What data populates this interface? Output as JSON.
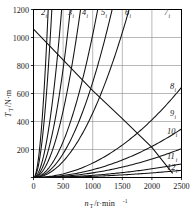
{
  "chart_data": {
    "type": "line",
    "title": "",
    "xlabel": "n_T /r·min⁻¹",
    "ylabel": "T_T /N·m",
    "xlim": [
      0,
      2500
    ],
    "ylim": [
      0,
      1200
    ],
    "xticks": [
      0,
      500,
      1000,
      1500,
      2000,
      2500
    ],
    "xticklabels": [
      "0",
      "500",
      "1000",
      "1500",
      "2000",
      "2500"
    ],
    "yticks": [
      0,
      200,
      400,
      600,
      800,
      1000,
      1200
    ],
    "yticklabels": [
      "0",
      "200",
      "400",
      "600",
      "800",
      "1000",
      "1200"
    ],
    "grid": true,
    "legend": "none",
    "x_axis_symbol": "n",
    "x_axis_subscript": "T",
    "x_axis_unit": "/r·min",
    "x_axis_unit_sup": "-1",
    "y_axis_symbol": "T",
    "y_axis_subscript": "T",
    "y_axis_unit": "/N·m",
    "series": [
      {
        "name": "1",
        "label": "1",
        "sub": "i",
        "label_visible": false,
        "kind": "rising-quadratic",
        "coef": 0.0195,
        "x_end": 248,
        "label_x": 36,
        "label_y": 14
      },
      {
        "name": "2",
        "label": "2",
        "sub": "i",
        "label_visible": true,
        "kind": "rising-quadratic",
        "coef": 0.0125,
        "x_end": 310,
        "label_x": 41,
        "label_y": 15
      },
      {
        "name": "3",
        "label": "3",
        "sub": "i",
        "label_visible": true,
        "kind": "rising-quadratic",
        "coef": 0.0053,
        "x_end": 476,
        "label_x": 68,
        "label_y": 15
      },
      {
        "name": "4",
        "label": "4",
        "sub": "i",
        "label_visible": true,
        "kind": "rising-quadratic",
        "coef": 0.0031,
        "x_end": 622,
        "label_x": 82,
        "label_y": 15
      },
      {
        "name": "5",
        "label": "5",
        "sub": "i",
        "label_visible": true,
        "kind": "rising-quadratic",
        "coef": 0.0019,
        "x_end": 795,
        "label_x": 101,
        "label_y": 15
      },
      {
        "name": "6",
        "label": "6",
        "sub": "i",
        "label_visible": true,
        "kind": "rising-quadratic",
        "coef": 0.00102,
        "x_end": 1085,
        "label_x": 125,
        "label_y": 15
      },
      {
        "name": "6b",
        "label": "",
        "sub": "",
        "label_visible": false,
        "kind": "rising-quadratic",
        "coef": 0.00068,
        "x_end": 1328,
        "label_x": 0,
        "label_y": 0
      },
      {
        "name": "7",
        "label": "7",
        "sub": "i",
        "label_visible": true,
        "kind": "rising-quadratic",
        "coef": 0.00046,
        "x_end": 1615,
        "label_x": 164,
        "label_y": 15
      },
      {
        "name": "8",
        "label": "8",
        "sub": "i",
        "label_visible": true,
        "kind": "rising-quadratic",
        "coef": 0.000103,
        "x_end": 2500,
        "label_x": 170,
        "label_y": 89
      },
      {
        "name": "9",
        "label": "9",
        "sub": "i",
        "label_visible": true,
        "kind": "rising-quadratic",
        "coef": 5.55e-05,
        "x_end": 2500,
        "label_x": 170,
        "label_y": 116
      },
      {
        "name": "10",
        "label": "10",
        "sub": "i",
        "label_visible": true,
        "kind": "rising-quadratic",
        "coef": 3.3e-05,
        "x_end": 2500,
        "label_x": 167,
        "label_y": 134
      },
      {
        "name": "11",
        "label": "11",
        "sub": "i",
        "label_visible": true,
        "kind": "rising-quadratic",
        "coef": 1.55e-05,
        "x_end": 2500,
        "label_x": 167,
        "label_y": 159
      },
      {
        "name": "12",
        "label": "12",
        "sub": "i",
        "label_visible": true,
        "kind": "rising-quadratic",
        "coef": 8.2e-06,
        "x_end": 2500,
        "label_x": 167,
        "label_y": 170
      },
      {
        "name": "resistance",
        "label": "",
        "sub": "",
        "label_visible": false,
        "kind": "descending",
        "points": [
          [
            0,
            1060
          ],
          [
            500,
            840
          ],
          [
            1000,
            620
          ],
          [
            1500,
            420
          ],
          [
            2000,
            215
          ],
          [
            2350,
            30
          ]
        ],
        "label_x": 0,
        "label_y": 0
      }
    ]
  }
}
